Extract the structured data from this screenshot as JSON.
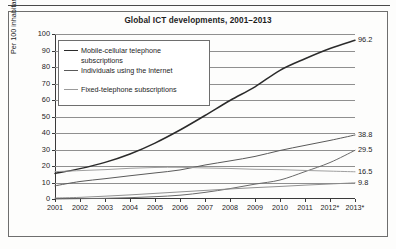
{
  "figure": {
    "title": "Global ICT developments, 2001–2013"
  },
  "axes": {
    "ylabel": "Per 100 inhabitants",
    "yticks": [
      "0",
      "10",
      "20",
      "30",
      "40",
      "50",
      "60",
      "70",
      "80",
      "90",
      "100"
    ],
    "xticks": [
      "2001",
      "2002",
      "2003",
      "2004",
      "2005",
      "2006",
      "2007",
      "2008",
      "2009",
      "2010",
      "2011",
      "2012*",
      "2013*"
    ]
  },
  "legend": {
    "items": [
      {
        "label": "Mobile-cellular telephone\nsubscriptions",
        "color": "#2b2b2b"
      },
      {
        "label": "Individuals using the Internet",
        "color": "#5a5a5a"
      },
      {
        "label": "Fixed-telephone subscriptions",
        "color": "#9a9a9a"
      }
    ]
  },
  "end_labels": {
    "mobile": "96.2",
    "internet": "38.8",
    "mobile_broadband": "29.5",
    "fixed_telephone": "16.5",
    "fixed_broadband": "9.8"
  },
  "chart_data": {
    "type": "line",
    "title": "Global ICT developments, 2001–2013",
    "xlabel": "",
    "ylabel": "Per 100 inhabitants",
    "x": [
      "2001",
      "2002",
      "2003",
      "2004",
      "2005",
      "2006",
      "2007",
      "2008",
      "2009",
      "2010",
      "2011",
      "2012*",
      "2013*"
    ],
    "xlim": [
      2001,
      2013
    ],
    "ylim": [
      0,
      100
    ],
    "yticks": [
      0,
      10,
      20,
      30,
      40,
      50,
      60,
      70,
      80,
      90,
      100
    ],
    "grid": true,
    "legend_position": "upper-left",
    "series": [
      {
        "name": "Mobile-cellular telephone subscriptions",
        "color": "#2b2b2b",
        "end_label": "96.2",
        "values": [
          15.5,
          18.4,
          22.2,
          27.3,
          33.9,
          41.8,
          50.6,
          59.7,
          68.0,
          78.0,
          85.0,
          91.2,
          96.2
        ]
      },
      {
        "name": "Individuals using the Internet",
        "color": "#5a5a5a",
        "end_label": "38.8",
        "values": [
          8.0,
          10.6,
          12.3,
          14.1,
          15.8,
          17.6,
          20.6,
          23.1,
          25.8,
          29.4,
          32.5,
          35.5,
          38.8
        ]
      },
      {
        "name": "Active mobile-broadband subscriptions",
        "color": "#6a6a6a",
        "end_label": "29.5",
        "values": [
          0.0,
          0.2,
          0.4,
          0.8,
          1.4,
          2.3,
          4.0,
          6.3,
          9.0,
          11.5,
          16.6,
          22.1,
          29.5
        ]
      },
      {
        "name": "Fixed-telephone subscriptions",
        "color": "#9a9a9a",
        "end_label": "16.5",
        "values": [
          16.6,
          17.2,
          17.8,
          18.6,
          19.1,
          19.2,
          18.8,
          18.5,
          18.0,
          17.8,
          17.3,
          16.9,
          16.5
        ]
      },
      {
        "name": "Fixed (wired)-broadband subscriptions",
        "color": "#8a8a8a",
        "end_label": "9.8",
        "values": [
          0.6,
          1.0,
          1.7,
          2.5,
          3.4,
          4.3,
          5.2,
          6.1,
          6.9,
          7.6,
          8.4,
          9.1,
          9.8
        ]
      }
    ]
  }
}
